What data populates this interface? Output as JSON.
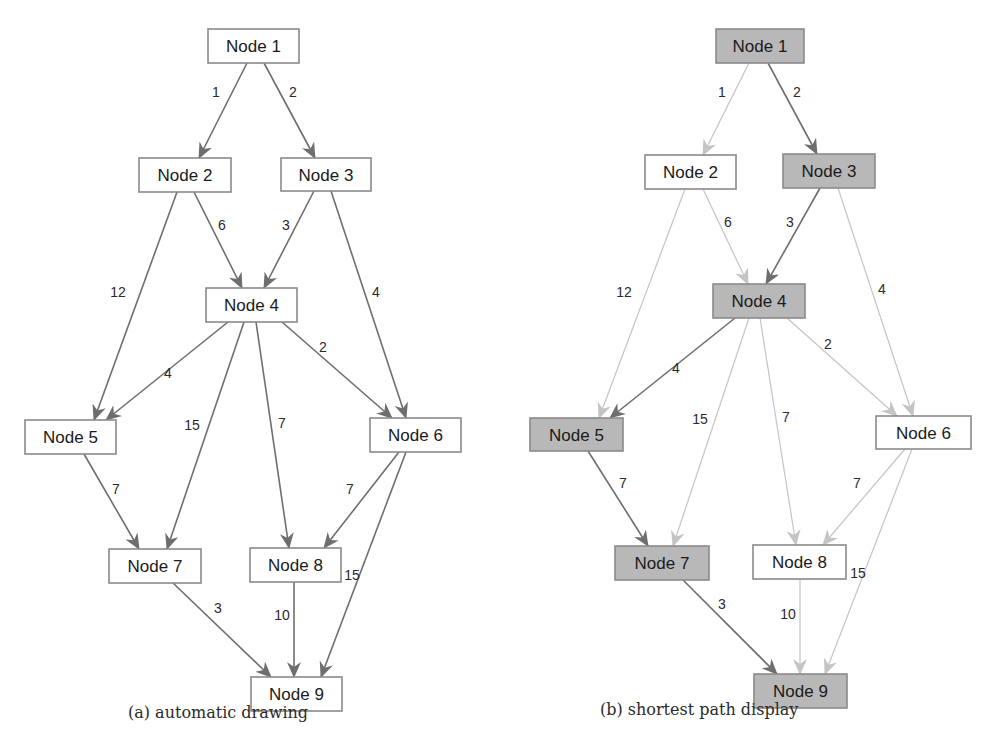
{
  "captions": {
    "a": "(a) automatic drawing",
    "b": "(b) shortest path display"
  },
  "colors": {
    "node_border": "#8a8a8a",
    "node_fill": "#ffffff",
    "node_fill_highlight": "#b4b4b4",
    "edge_dark": "#6e6e6e",
    "edge_light": "#c4c4c4"
  },
  "graph": {
    "nodes": [
      {
        "id": "n1",
        "label": "Node 1"
      },
      {
        "id": "n2",
        "label": "Node 2"
      },
      {
        "id": "n3",
        "label": "Node 3"
      },
      {
        "id": "n4",
        "label": "Node 4"
      },
      {
        "id": "n5",
        "label": "Node 5"
      },
      {
        "id": "n6",
        "label": "Node 6"
      },
      {
        "id": "n7",
        "label": "Node 7"
      },
      {
        "id": "n8",
        "label": "Node 8"
      },
      {
        "id": "n9",
        "label": "Node 9"
      }
    ],
    "edges": [
      {
        "from": "n1",
        "to": "n2",
        "weight": "1"
      },
      {
        "from": "n1",
        "to": "n3",
        "weight": "2"
      },
      {
        "from": "n2",
        "to": "n4",
        "weight": "6"
      },
      {
        "from": "n2",
        "to": "n5",
        "weight": "12"
      },
      {
        "from": "n3",
        "to": "n4",
        "weight": "3"
      },
      {
        "from": "n3",
        "to": "n6",
        "weight": "4"
      },
      {
        "from": "n4",
        "to": "n5",
        "weight": "4"
      },
      {
        "from": "n4",
        "to": "n6",
        "weight": "2"
      },
      {
        "from": "n4",
        "to": "n7",
        "weight": "15"
      },
      {
        "from": "n4",
        "to": "n8",
        "weight": "7"
      },
      {
        "from": "n5",
        "to": "n7",
        "weight": "7"
      },
      {
        "from": "n6",
        "to": "n8",
        "weight": "7"
      },
      {
        "from": "n6",
        "to": "n9",
        "weight": "15"
      },
      {
        "from": "n7",
        "to": "n9",
        "weight": "3"
      },
      {
        "from": "n8",
        "to": "n9",
        "weight": "10"
      }
    ]
  },
  "panels": [
    {
      "id": "a",
      "title": "automatic drawing",
      "highlight_nodes": [],
      "highlight_edges": [],
      "positions": {
        "n1": [
          208,
          29,
          91,
          34
        ],
        "n2": [
          139,
          158,
          92,
          34
        ],
        "n3": [
          281,
          158,
          90,
          33
        ],
        "n4": [
          206,
          288,
          91,
          34
        ],
        "n5": [
          25,
          420,
          91,
          34
        ],
        "n6": [
          370,
          418,
          91,
          34
        ],
        "n7": [
          109,
          549,
          92,
          34
        ],
        "n8": [
          250,
          548,
          91,
          34
        ],
        "n9": [
          251,
          677,
          91,
          34
        ]
      },
      "edge_anchors": {
        "n1-n2": [
          [
            247,
            63
          ],
          [
            199,
            158
          ],
          [
            216,
            97
          ]
        ],
        "n1-n3": [
          [
            264,
            63
          ],
          [
            315,
            158
          ],
          [
            293,
            97
          ]
        ],
        "n2-n4": [
          [
            194,
            192
          ],
          [
            242,
            288
          ],
          [
            222,
            230
          ]
        ],
        "n2-n5": [
          [
            177,
            192
          ],
          [
            94,
            420
          ],
          [
            118,
            297
          ]
        ],
        "n3-n4": [
          [
            314,
            191
          ],
          [
            264,
            288
          ],
          [
            286,
            230
          ]
        ],
        "n3-n6": [
          [
            331,
            191
          ],
          [
            406,
            418
          ],
          [
            376,
            297
          ]
        ],
        "n4-n5": [
          [
            228,
            322
          ],
          [
            106,
            420
          ],
          [
            168,
            378
          ]
        ],
        "n4-n6": [
          [
            282,
            322
          ],
          [
            392,
            418
          ],
          [
            323,
            352
          ]
        ],
        "n4-n7": [
          [
            244,
            322
          ],
          [
            167,
            549
          ],
          [
            192,
            430
          ]
        ],
        "n4-n8": [
          [
            256,
            322
          ],
          [
            289,
            548
          ],
          [
            282,
            428
          ]
        ],
        "n5-n7": [
          [
            84,
            454
          ],
          [
            139,
            549
          ],
          [
            116,
            494
          ]
        ],
        "n6-n8": [
          [
            399,
            452
          ],
          [
            324,
            548
          ],
          [
            350,
            494
          ]
        ],
        "n6-n9": [
          [
            406,
            452
          ],
          [
            321,
            677
          ],
          [
            352,
            580
          ]
        ],
        "n7-n9": [
          [
            173,
            583
          ],
          [
            271,
            677
          ],
          [
            218,
            613
          ]
        ],
        "n8-n9": [
          [
            294,
            582
          ],
          [
            294,
            677
          ],
          [
            282,
            620
          ]
        ]
      }
    },
    {
      "id": "b",
      "title": "shortest path display",
      "highlight_nodes": [
        "n1",
        "n3",
        "n4",
        "n5",
        "n7",
        "n9"
      ],
      "highlight_edges": [
        "n1-n3",
        "n3-n4",
        "n4-n5",
        "n5-n7",
        "n7-n9"
      ],
      "positions": {
        "n1": [
          716,
          29,
          88,
          34
        ],
        "n2": [
          645,
          155,
          91,
          34
        ],
        "n3": [
          783,
          154,
          92,
          34
        ],
        "n4": [
          713,
          284,
          92,
          34
        ],
        "n5": [
          530,
          418,
          93,
          33
        ],
        "n6": [
          876,
          416,
          95,
          33
        ],
        "n7": [
          615,
          546,
          94,
          34
        ],
        "n8": [
          753,
          545,
          93,
          34
        ],
        "n9": [
          754,
          674,
          93,
          34
        ]
      },
      "edge_anchors": {
        "n1-n2": [
          [
            749,
            63
          ],
          [
            703,
            155
          ],
          [
            722,
            97
          ]
        ],
        "n1-n3": [
          [
            768,
            63
          ],
          [
            817,
            154
          ],
          [
            797,
            97
          ]
        ],
        "n2-n4": [
          [
            703,
            189
          ],
          [
            748,
            284
          ],
          [
            728,
            227
          ]
        ],
        "n2-n5": [
          [
            685,
            189
          ],
          [
            599,
            418
          ],
          [
            624,
            297
          ]
        ],
        "n3-n4": [
          [
            820,
            188
          ],
          [
            766,
            284
          ],
          [
            790,
            227
          ]
        ],
        "n3-n6": [
          [
            838,
            188
          ],
          [
            913,
            416
          ],
          [
            882,
            294
          ]
        ],
        "n4-n5": [
          [
            735,
            318
          ],
          [
            610,
            418
          ],
          [
            676,
            373
          ]
        ],
        "n4-n6": [
          [
            787,
            318
          ],
          [
            897,
            416
          ],
          [
            828,
            349
          ]
        ],
        "n4-n7": [
          [
            749,
            318
          ],
          [
            673,
            546
          ],
          [
            700,
            424
          ]
        ],
        "n4-n8": [
          [
            760,
            318
          ],
          [
            796,
            545
          ],
          [
            786,
            422
          ]
        ],
        "n5-n7": [
          [
            588,
            451
          ],
          [
            648,
            546
          ],
          [
            623,
            488
          ]
        ],
        "n6-n8": [
          [
            905,
            449
          ],
          [
            823,
            545
          ],
          [
            857,
            488
          ]
        ],
        "n6-n9": [
          [
            912,
            449
          ],
          [
            825,
            674
          ],
          [
            858,
            578
          ]
        ],
        "n7-n9": [
          [
            683,
            580
          ],
          [
            777,
            674
          ],
          [
            722,
            609
          ]
        ],
        "n8-n9": [
          [
            800,
            579
          ],
          [
            800,
            674
          ],
          [
            788,
            619
          ]
        ]
      }
    }
  ]
}
